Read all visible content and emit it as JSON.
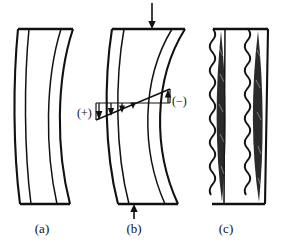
{
  "figure": {
    "background_color": "#ffffff",
    "line_color": "#111111",
    "panel_count": 3
  },
  "panels": [
    {
      "id": "a",
      "caption": "(a)",
      "description": "Laterally deflected column bowing to the left, drawn with four curved longitudinal lines and straight horizontal end caps",
      "curve_lines": 4,
      "has_load_arrows": false,
      "has_stress_diagram": false,
      "has_cracking": false,
      "top_x_range": [
        18,
        73
      ],
      "bottom_x_range": [
        20,
        70
      ],
      "y_range": [
        28,
        205
      ]
    },
    {
      "id": "b",
      "caption": "(b)",
      "description": "Same deflected column with axial load arrows at both ends and a linear bending stress distribution across the mid-height section",
      "curve_lines": 4,
      "has_load_arrows": true,
      "has_stress_diagram": true,
      "has_cracking": false,
      "top_x_range": [
        112,
        185
      ],
      "bottom_x_range": [
        118,
        178
      ],
      "y_range": [
        28,
        205
      ]
    },
    {
      "id": "c",
      "caption": "(c)",
      "description": "Straight column with wavy spalled edges and two dark lens shaped crushed/cracked zones",
      "curve_lines": 4,
      "has_load_arrows": false,
      "has_stress_diagram": false,
      "has_cracking": true,
      "top_x_range": [
        213,
        268
      ],
      "bottom_x_range": [
        212,
        265
      ],
      "y_range": [
        28,
        205
      ]
    }
  ],
  "load_arrows": [
    {
      "name": "top-load-arrow",
      "direction": "down",
      "x": 152,
      "y_start": 3,
      "y_end": 28
    },
    {
      "name": "bottom-load-arrow",
      "direction": "up",
      "x": 134,
      "y_start": 219,
      "y_end": 204
    }
  ],
  "stress_diagram": {
    "label_positive": "(+)",
    "label_negative": "(−)",
    "positive_side": "left",
    "negative_side": "right",
    "distribution": "linear",
    "neutral_axis_x": 141,
    "baseline_y": 103,
    "left_x": 96,
    "right_x": 170,
    "left_ordinate": 17,
    "right_ordinate": -14,
    "arrow_count_positive": 4,
    "arrow_count_negative": 1,
    "arrow_positions_x": [
      99,
      111,
      122,
      133,
      168
    ]
  },
  "annotations": {
    "caption_a": "(a)",
    "caption_b": "(b)",
    "caption_c": "(c)",
    "plus_label": "(+)",
    "minus_label": "(−)"
  },
  "colors": {
    "ink": "#111111",
    "paper": "#ffffff",
    "crack_fill": "#1a1a1a"
  }
}
